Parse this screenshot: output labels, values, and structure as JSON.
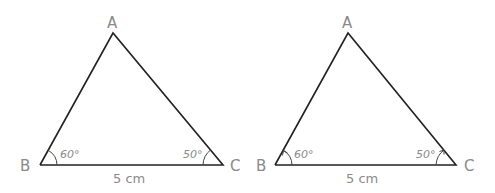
{
  "diagrams": [
    {
      "id": "left",
      "vertices": {
        "A": "A",
        "B": "B",
        "C": "C"
      },
      "angle_B": "60°",
      "angle_C": "50°",
      "base_length": "5 cm",
      "arc_arrows": false
    },
    {
      "id": "right",
      "vertices": {
        "A": "A",
        "B": "B",
        "C": "C"
      },
      "angle_B": "60°",
      "angle_C": "50°",
      "base_length": "5 cm",
      "arc_arrows": true
    }
  ]
}
